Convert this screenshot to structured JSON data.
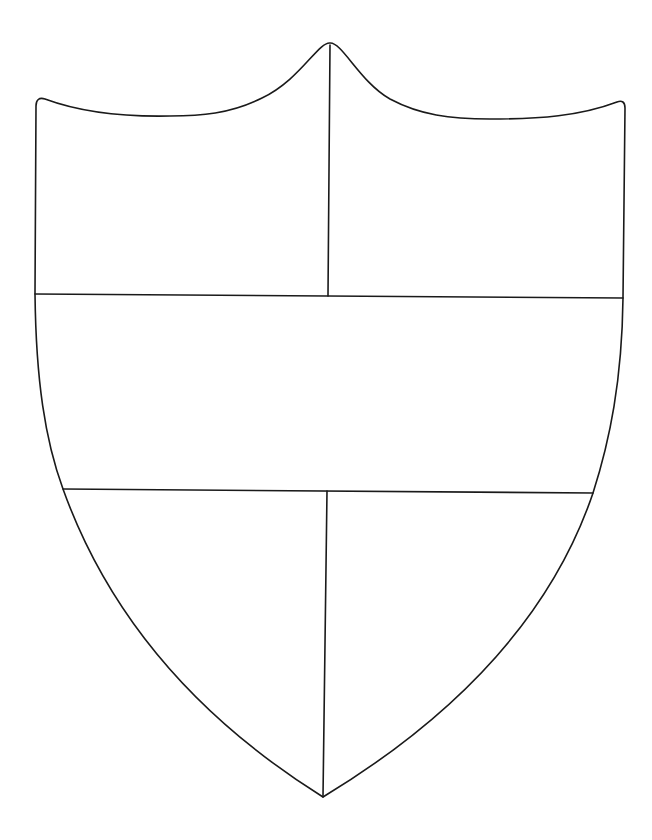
{
  "diagram": {
    "stroke_color": "#1a1a1a",
    "background": "#ffffff",
    "sections": [
      "top-left",
      "top-right",
      "middle-band",
      "bottom-left",
      "bottom-right"
    ]
  }
}
